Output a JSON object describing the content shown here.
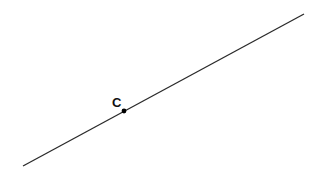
{
  "diagram": {
    "type": "line-with-point",
    "line": {
      "x1": 23,
      "y1": 166,
      "x2": 304,
      "y2": 14,
      "color": "#2a2a2a"
    },
    "point": {
      "label": "C",
      "x": 124,
      "y": 111,
      "color": "#000000"
    },
    "label_position": {
      "x": 112,
      "y": 107
    }
  }
}
